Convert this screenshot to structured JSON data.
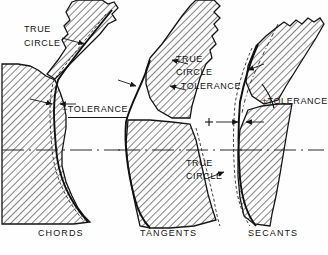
{
  "figure": {
    "type": "technical-drawing",
    "background_color": "#ffffff",
    "ink_color": "#141414",
    "hatch_angle_deg": 45
  },
  "panels": [
    {
      "id": "chords",
      "caption": "CHORDS",
      "caption_x": 38,
      "caption_y": 234,
      "annotations": [
        {
          "name": "true-circle",
          "text_line1": "TRUE",
          "text_line2": "CIRCLE",
          "x": 24,
          "y": 28
        },
        {
          "name": "tolerance",
          "text": "−TOLERANCE",
          "x": 62,
          "y": 109,
          "underlined": true
        }
      ]
    },
    {
      "id": "tangents",
      "caption": "TANGENTS",
      "caption_x": 140,
      "caption_y": 234,
      "annotations": [
        {
          "name": "true-circle-upper",
          "text_line1": "TRUE",
          "text_line2": "CIRCLE",
          "x": 176,
          "y": 58
        },
        {
          "name": "plus-tolerance",
          "text": "+ TOLERANCE",
          "x": 172,
          "y": 87
        },
        {
          "name": "true-circle-lower",
          "text_line1": "TRUE",
          "text_line2": "CIRCLE",
          "x": 186,
          "y": 163
        }
      ]
    },
    {
      "id": "secants",
      "caption": "SECANTS",
      "caption_x": 248,
      "caption_y": 234,
      "annotations": [
        {
          "name": "plus-minus-tolerance",
          "text": "±TOLERANCE",
          "x": 262,
          "y": 101
        },
        {
          "name": "plus-marker",
          "text": "+",
          "x": 207,
          "y": 117
        }
      ]
    }
  ],
  "centerline": {
    "name": "horizontal-centerline",
    "style": "dash-dot",
    "y": 150,
    "x_start": 0,
    "x_end": 326
  }
}
